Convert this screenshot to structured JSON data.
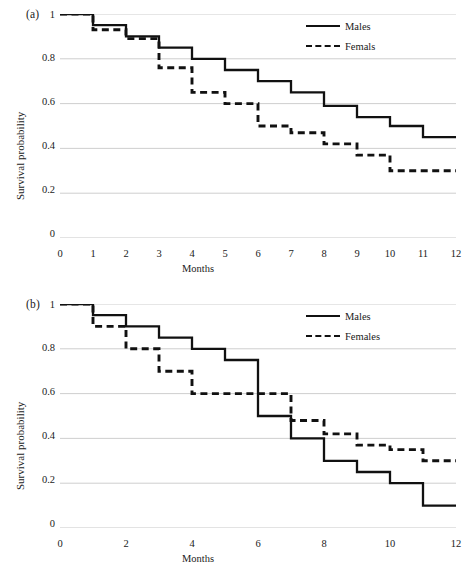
{
  "figure": {
    "background_color": "#ffffff",
    "line_color": "#111111",
    "grid_color": "#c8c8c8"
  },
  "panels": [
    {
      "tag": "(a)",
      "xlabel": "Months",
      "ylabel": "Survival probability",
      "yticks": [
        "1",
        "0.8",
        "0.6",
        "0.4",
        "0.2",
        "0"
      ],
      "xticks": [
        "0",
        "1",
        "2",
        "3",
        "4",
        "5",
        "6",
        "7",
        "8",
        "9",
        "10",
        "11",
        "12"
      ],
      "legend": [
        {
          "label": "Males",
          "style": "solid"
        },
        {
          "label": "Femals",
          "style": "dashed"
        }
      ]
    },
    {
      "tag": "(b)",
      "xlabel": "Months",
      "ylabel": "Survival probability",
      "yticks": [
        "1",
        "0.8",
        "0.6",
        "0.4",
        "0.2",
        "0"
      ],
      "xticks": [
        "0",
        "2",
        "4",
        "6",
        "8",
        "10",
        "12"
      ],
      "legend": [
        {
          "label": "Males",
          "style": "solid"
        },
        {
          "label": "Females",
          "style": "dashed"
        }
      ]
    }
  ],
  "chart_data": [
    {
      "type": "line",
      "subtype": "step-post",
      "title": "(a)",
      "xlabel": "Months",
      "ylabel": "Survival probability",
      "xlim": [
        0,
        12
      ],
      "ylim": [
        0,
        1
      ],
      "xticks": [
        0,
        1,
        2,
        3,
        4,
        5,
        6,
        7,
        8,
        9,
        10,
        11,
        12
      ],
      "yticks": [
        0,
        0.2,
        0.4,
        0.6,
        0.8,
        1
      ],
      "grid": "horizontal",
      "legend_position": "top-right",
      "x": [
        0,
        1,
        2,
        3,
        4,
        5,
        6,
        7,
        8,
        9,
        10,
        11,
        12
      ],
      "series": [
        {
          "name": "Males",
          "style": "solid",
          "values": [
            1.0,
            0.95,
            0.9,
            0.85,
            0.8,
            0.75,
            0.7,
            0.65,
            0.59,
            0.54,
            0.5,
            0.45,
            0.45
          ]
        },
        {
          "name": "Femals",
          "style": "dashed",
          "values": [
            1.0,
            0.93,
            0.89,
            0.76,
            0.65,
            0.6,
            0.5,
            0.47,
            0.42,
            0.37,
            0.3,
            0.3,
            0.3
          ]
        }
      ]
    },
    {
      "type": "line",
      "subtype": "step-post",
      "title": "(b)",
      "xlabel": "Months",
      "ylabel": "Survival probability",
      "xlim": [
        0,
        12
      ],
      "ylim": [
        0,
        1
      ],
      "xticks": [
        0,
        2,
        4,
        6,
        8,
        10,
        12
      ],
      "yticks": [
        0,
        0.2,
        0.4,
        0.6,
        0.8,
        1
      ],
      "grid": "horizontal",
      "legend_position": "top-right",
      "x": [
        0,
        1,
        2,
        3,
        4,
        5,
        6,
        7,
        8,
        9,
        10,
        11,
        12
      ],
      "series": [
        {
          "name": "Males",
          "style": "solid",
          "values": [
            1.0,
            0.95,
            0.9,
            0.85,
            0.8,
            0.75,
            0.5,
            0.4,
            0.3,
            0.25,
            0.2,
            0.1,
            0.1
          ]
        },
        {
          "name": "Females",
          "style": "dashed",
          "values": [
            1.0,
            0.9,
            0.8,
            0.7,
            0.6,
            0.6,
            0.6,
            0.48,
            0.42,
            0.37,
            0.35,
            0.3,
            0.3
          ]
        }
      ]
    }
  ]
}
